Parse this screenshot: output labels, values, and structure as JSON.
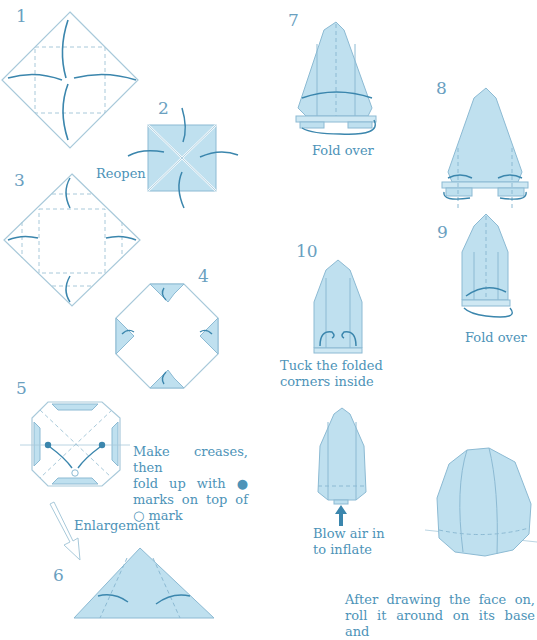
{
  "colors": {
    "paper_fill": "#bfe0ef",
    "paper_fill_dark": "#a9d3e8",
    "outline": "#8cbad3",
    "arrow": "#3b86ad",
    "text": "#4d93b8"
  },
  "steps": [
    {
      "number": "1"
    },
    {
      "number": "2",
      "caption": "Reopen"
    },
    {
      "number": "3"
    },
    {
      "number": "4"
    },
    {
      "number": "5",
      "caption_lines": [
        "Make creases, then",
        "fold up with ●",
        "marks on top of",
        "○ mark"
      ]
    },
    {
      "number": "6"
    },
    {
      "number": "7",
      "caption": "Fold over"
    },
    {
      "number": "8"
    },
    {
      "number": "9",
      "caption": "Fold over"
    },
    {
      "number": "10",
      "caption_lines": [
        "Tuck the folded",
        "corners inside"
      ]
    }
  ],
  "enlargement_label": "Enlargement",
  "inflate_caption": [
    "Blow air in",
    "to inflate"
  ],
  "final_caption": [
    "After drawing the face on,",
    "roll it around on its base and"
  ]
}
